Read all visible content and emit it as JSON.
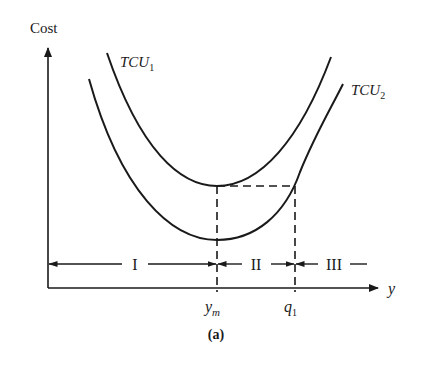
{
  "figure": {
    "y_axis_label": "Cost",
    "x_axis_label": "y",
    "caption": "(a)",
    "curves": [
      {
        "name": "TCU",
        "subscript": "1"
      },
      {
        "name": "TCU",
        "subscript": "2"
      }
    ],
    "x_marks": [
      {
        "base": "y",
        "subscript": "m"
      },
      {
        "base": "q",
        "subscript": "1"
      }
    ],
    "regions": [
      "I",
      "II",
      "III"
    ],
    "colors": {
      "ink": "#1a1a1a",
      "background": "#ffffff"
    }
  }
}
